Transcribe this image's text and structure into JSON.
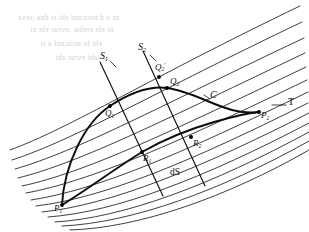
{
  "figure": {
    "ink_color": "#111111",
    "family_color": "#222222",
    "background": "#ffffff",
    "bleed_color": "#c9c9c9"
  },
  "labels": {
    "s1": {
      "text": "S",
      "sub": "1",
      "prime": ""
    },
    "s2": {
      "text": "S",
      "sub": "2",
      "prime": ""
    },
    "p1": {
      "text": "P",
      "sub": "1",
      "prime": ""
    },
    "p2": {
      "text": "P",
      "sub": "2",
      "prime": ""
    },
    "q1": {
      "text": "Q",
      "sub": "1",
      "prime": ""
    },
    "q2": {
      "text": "Q",
      "sub": "2",
      "prime": ""
    },
    "q2p": {
      "text": "Q",
      "sub": "2",
      "prime": "'"
    },
    "r1": {
      "text": "R",
      "sub": "1",
      "prime": ""
    },
    "r2": {
      "text": "R",
      "sub": "2",
      "prime": ""
    },
    "curve_c": {
      "text": "C",
      "sub": "",
      "prime": ""
    },
    "tangent_t": {
      "text": "T",
      "sub": "",
      "prime": ""
    },
    "arc_ds": {
      "text": "dS",
      "sub": "",
      "prime": ""
    }
  },
  "bleed_text": {
    "line1": "ni o d noitcnuf eht si  dna  ,sexa",
    "line2": "ni  eht  erehw  ,evruc eht  ni",
    "line3": "eht fo noitcnuf a si",
    "line4": "si taht  evruc eht"
  },
  "points": {
    "p1": {
      "x": 62,
      "y": 205
    },
    "q1": {
      "x": 110,
      "y": 106
    },
    "q2": {
      "x": 167,
      "y": 88
    },
    "q2p": {
      "x": 160,
      "y": 75
    },
    "r1": {
      "x": 142,
      "y": 152
    },
    "r2": {
      "x": 191,
      "y": 137
    },
    "p2": {
      "x": 259,
      "y": 112
    }
  },
  "geometry": {
    "family_curve_count": 13,
    "transversal_count": 2,
    "extremal_arcs": 2
  }
}
